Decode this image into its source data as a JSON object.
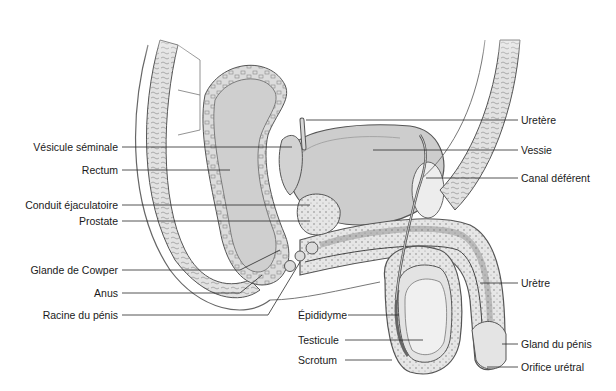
{
  "diagram": {
    "style": {
      "line_color": "#2a2a2a",
      "tissue_fill": "#d9d9d9",
      "organ_fill": "#c6c6c6",
      "light_fill": "#ececec",
      "outline": "#555555"
    },
    "labels_left": [
      {
        "id": "vesicule-seminale",
        "text": "Vésicule séminale",
        "x": 118,
        "y": 147,
        "line_to": [
          292,
          147
        ]
      },
      {
        "id": "rectum",
        "text": "Rectum",
        "x": 118,
        "y": 170,
        "line_to": [
          230,
          170
        ]
      },
      {
        "id": "conduit-ejaculatoire",
        "text": "Conduit éjaculatoire",
        "x": 118,
        "y": 205,
        "line_to": [
          310,
          205
        ]
      },
      {
        "id": "prostate",
        "text": "Prostate",
        "x": 118,
        "y": 221,
        "line_to": [
          310,
          221
        ]
      },
      {
        "id": "glande-de-cowper",
        "text": "Glande de Cowper",
        "x": 118,
        "y": 270,
        "line_to": [
          280,
          270
        ]
      },
      {
        "id": "anus",
        "text": "Anus",
        "x": 118,
        "y": 293,
        "line_to": [
          240,
          293
        ]
      },
      {
        "id": "racine-du-penis",
        "text": "Racine du pénis",
        "x": 118,
        "y": 315,
        "line_to": [
          268,
          315
        ]
      }
    ],
    "labels_right": [
      {
        "id": "uretere",
        "text": "Uretère",
        "x": 521,
        "y": 120,
        "line_from": [
          306,
          120
        ]
      },
      {
        "id": "vessie",
        "text": "Vessie",
        "x": 521,
        "y": 150,
        "line_from": [
          373,
          150
        ]
      },
      {
        "id": "canal-deferent",
        "text": "Canal déférent",
        "x": 521,
        "y": 178,
        "line_from": [
          426,
          178
        ]
      },
      {
        "id": "uretre",
        "text": "Urètre",
        "x": 521,
        "y": 283,
        "line_from": [
          480,
          283
        ]
      },
      {
        "id": "gland-du-penis",
        "text": "Gland du pénis",
        "x": 521,
        "y": 344,
        "line_from": [
          502,
          344
        ]
      },
      {
        "id": "orifice-uretral",
        "text": "Orifice urétral",
        "x": 521,
        "y": 367,
        "line_from": [
          487,
          367
        ]
      }
    ],
    "labels_center": [
      {
        "id": "epididyme",
        "text": "Épididyme",
        "x": 298,
        "y": 315,
        "line_to": [
          399,
          315
        ]
      },
      {
        "id": "testicule",
        "text": "Testicule",
        "x": 298,
        "y": 340,
        "line_to": [
          423,
          340
        ]
      },
      {
        "id": "scrotum",
        "text": "Scrotum",
        "x": 298,
        "y": 360,
        "line_to": [
          392,
          360
        ]
      }
    ]
  }
}
